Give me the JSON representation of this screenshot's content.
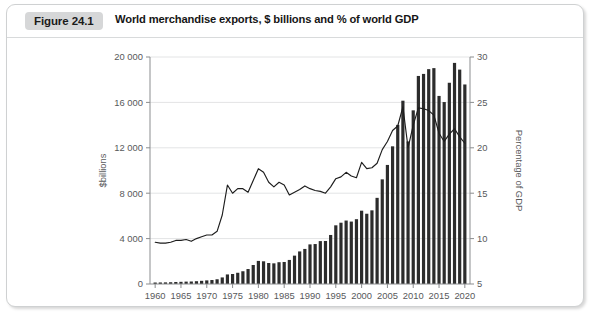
{
  "figure": {
    "badge": "Figure 24.1",
    "caption": "World merchandise exports, $ billions and % of world GDP"
  },
  "chart_data": {
    "type": "bar",
    "title": "World merchandise exports, $ billions and % of world GDP",
    "xlabel": "",
    "ylabel": "$billions",
    "y2label": "Percentage of GDP",
    "grid": true,
    "legend": "none",
    "xlim": [
      1959,
      2021
    ],
    "ylim": [
      0,
      20000
    ],
    "y2lim": [
      5,
      30
    ],
    "yticks": [
      "0",
      "4 000",
      "8 000",
      "12 000",
      "16 000",
      "20 000"
    ],
    "ytick_values": [
      0,
      4000,
      8000,
      12000,
      16000,
      20000
    ],
    "y2ticks": [
      "5",
      "10",
      "15",
      "20",
      "25",
      "30"
    ],
    "y2tick_values": [
      5,
      10,
      15,
      20,
      25,
      30
    ],
    "xticks": [
      "1960",
      "1965",
      "1970",
      "1975",
      "1980",
      "1985",
      "1990",
      "1995",
      "2000",
      "2005",
      "2010",
      "2015",
      "2020"
    ],
    "xtick_values": [
      1960,
      1965,
      1970,
      1975,
      1980,
      1985,
      1990,
      1995,
      2000,
      2005,
      2010,
      2015,
      2020
    ],
    "x": [
      1960,
      1961,
      1962,
      1963,
      1964,
      1965,
      1966,
      1967,
      1968,
      1969,
      1970,
      1971,
      1972,
      1973,
      1974,
      1975,
      1976,
      1977,
      1978,
      1979,
      1980,
      1981,
      1982,
      1983,
      1984,
      1985,
      1986,
      1987,
      1988,
      1989,
      1990,
      1991,
      1992,
      1993,
      1994,
      1995,
      1996,
      1997,
      1998,
      1999,
      2000,
      2001,
      2002,
      2003,
      2004,
      2005,
      2006,
      2007,
      2008,
      2009,
      2010,
      2011,
      2012,
      2013,
      2014,
      2015,
      2016,
      2017,
      2018,
      2019,
      2020
    ],
    "series": [
      {
        "name": "World merchandise exports",
        "units": "$ billions",
        "axis": "left",
        "render": "bar",
        "values": [
          130,
          136,
          143,
          156,
          177,
          192,
          211,
          220,
          246,
          280,
          318,
          351,
          418,
          579,
          842,
          880,
          989,
          1123,
          1320,
          1674,
          2034,
          2000,
          1850,
          1820,
          1920,
          1940,
          2120,
          2500,
          2870,
          3090,
          3490,
          3520,
          3780,
          3790,
          4320,
          5170,
          5400,
          5590,
          5500,
          5710,
          6460,
          6190,
          6490,
          7590,
          9220,
          10490,
          12130,
          14020,
          16150,
          12560,
          15300,
          18330,
          18510,
          18930,
          19020,
          16570,
          16030,
          17730,
          19480,
          18890,
          17580
        ]
      },
      {
        "name": "Merchandise exports as % of world GDP",
        "units": "percentage of GDP",
        "axis": "right",
        "render": "line",
        "values": [
          9.6,
          9.5,
          9.5,
          9.6,
          9.8,
          9.8,
          9.9,
          9.7,
          10.0,
          10.2,
          10.4,
          10.4,
          10.8,
          12.6,
          15.9,
          15.0,
          15.5,
          15.5,
          15.1,
          16.4,
          17.7,
          17.3,
          16.2,
          15.7,
          16.2,
          15.9,
          14.8,
          15.1,
          15.4,
          15.8,
          15.5,
          15.3,
          15.2,
          15.0,
          15.7,
          16.6,
          16.8,
          17.3,
          16.9,
          16.7,
          18.4,
          17.7,
          17.8,
          18.3,
          19.8,
          20.7,
          21.9,
          22.4,
          24.5,
          20.0,
          22.5,
          24.4,
          24.3,
          24.1,
          23.6,
          21.6,
          20.7,
          21.5,
          22.1,
          21.2,
          20.5
        ]
      }
    ]
  }
}
